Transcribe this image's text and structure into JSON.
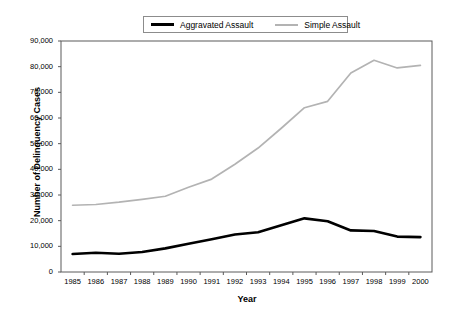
{
  "chart_data": {
    "type": "line",
    "title": "",
    "xlabel": "Year",
    "ylabel": "Number of Delinquency Cases",
    "categories": [
      "1985",
      "1986",
      "1987",
      "1988",
      "1989",
      "1990",
      "1991",
      "1992",
      "1993",
      "1994",
      "1995",
      "1996",
      "1997",
      "1998",
      "1999",
      "2000"
    ],
    "x": [
      1985,
      1986,
      1987,
      1988,
      1989,
      1990,
      1991,
      1992,
      1993,
      1994,
      1995,
      1996,
      1997,
      1998,
      1999,
      2000
    ],
    "xlim": [
      1985,
      2000
    ],
    "ylim": [
      0,
      90000
    ],
    "yticks": [
      0,
      10000,
      20000,
      30000,
      40000,
      50000,
      60000,
      70000,
      80000,
      90000
    ],
    "ytick_labels": [
      "0",
      "10,000",
      "20,000",
      "30,000",
      "40,000",
      "50,000",
      "60,000",
      "70,000",
      "80,000",
      "90,000"
    ],
    "grid": false,
    "legend_position": "top-center",
    "series": [
      {
        "name": "Aggravated Assault",
        "color": "#000000",
        "values": [
          7000,
          7500,
          7100,
          7800,
          9200,
          11000,
          12800,
          14600,
          15500,
          18200,
          20900,
          19800,
          16200,
          16000,
          13800,
          13600
        ]
      },
      {
        "name": "Simple Assault",
        "color": "#b3b3b3",
        "values": [
          26000,
          26300,
          27200,
          28300,
          29500,
          33000,
          36200,
          42000,
          48300,
          56000,
          64000,
          66500,
          77500,
          82500,
          79500,
          80500
        ]
      }
    ]
  },
  "legend": {
    "items": [
      {
        "label": "Aggravated Assault",
        "color": "#000000"
      },
      {
        "label": "Simple Assault",
        "color": "#b3b3b3"
      }
    ]
  },
  "axes": {
    "y_title": "Number of Delinquency Cases",
    "x_title": "Year"
  }
}
